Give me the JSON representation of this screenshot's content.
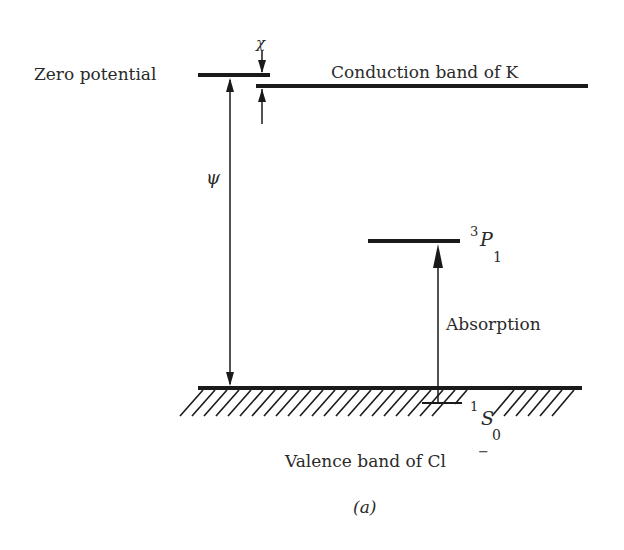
{
  "diagram": {
    "type": "energy-level-diagram",
    "labels": {
      "zero_potential": "Zero potential",
      "conduction_band": "Conduction band of K",
      "chi": "χ",
      "psi": "ψ",
      "excited_state_sup": "3",
      "excited_state_letter": "P",
      "excited_state_sub": "1",
      "absorption": "Absorption",
      "ground_state_sup": "1",
      "ground_state_letter": "S",
      "ground_state_sub": "0",
      "valence_band_prefix": "Valence band of Cl",
      "valence_band_charge": "−",
      "caption": "(a)"
    },
    "colors": {
      "line": "#1a1a1a",
      "text": "#2a2a2a",
      "background": "#ffffff"
    }
  }
}
